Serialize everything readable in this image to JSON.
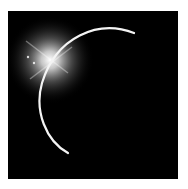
{
  "image": {
    "subject": "eclipse crescent with sun flare",
    "background_color": "#000000",
    "frame_color": "#ffffff",
    "glow_color": "#ffffff",
    "crescent_color": "#f4f4f4"
  }
}
